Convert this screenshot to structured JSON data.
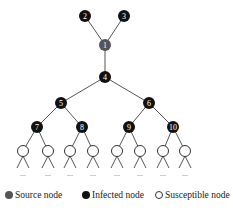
{
  "colors": {
    "source": "#555555",
    "infected": "#111111",
    "susceptible": "#ffffff",
    "edge": "#555555"
  },
  "nodes": [
    {
      "id": "1",
      "label": "1",
      "type": "source",
      "x": 105,
      "y": 45
    },
    {
      "id": "2",
      "label": "2",
      "type": "infected",
      "x": 85,
      "y": 16
    },
    {
      "id": "3",
      "label": "3",
      "type": "infected",
      "x": 124,
      "y": 16
    },
    {
      "id": "4",
      "label": "4",
      "type": "infected",
      "x": 105,
      "y": 77
    },
    {
      "id": "5",
      "label": "5",
      "type": "infected",
      "x": 61,
      "y": 103
    },
    {
      "id": "6",
      "label": "6",
      "type": "infected",
      "x": 149,
      "y": 103
    },
    {
      "id": "7",
      "label": "7",
      "type": "infected",
      "x": 37,
      "y": 127
    },
    {
      "id": "8",
      "label": "8",
      "type": "infected",
      "x": 82,
      "y": 127
    },
    {
      "id": "9",
      "label": "9",
      "type": "infected",
      "x": 129,
      "y": 127
    },
    {
      "id": "10",
      "label": "10",
      "type": "infected",
      "x": 173,
      "y": 127
    }
  ],
  "leaves": [
    {
      "parent": "7",
      "x": 23,
      "y": 151
    },
    {
      "parent": "7",
      "x": 48,
      "y": 151
    },
    {
      "parent": "8",
      "x": 70,
      "y": 151
    },
    {
      "parent": "8",
      "x": 93,
      "y": 151
    },
    {
      "parent": "9",
      "x": 117,
      "y": 151
    },
    {
      "parent": "9",
      "x": 140,
      "y": 151
    },
    {
      "parent": "10",
      "x": 163,
      "y": 151
    },
    {
      "parent": "10",
      "x": 185,
      "y": 151
    }
  ],
  "edges": [
    [
      "2",
      "1"
    ],
    [
      "3",
      "1"
    ],
    [
      "1",
      "4"
    ],
    [
      "4",
      "5"
    ],
    [
      "4",
      "6"
    ],
    [
      "5",
      "7"
    ],
    [
      "5",
      "8"
    ],
    [
      "6",
      "9"
    ],
    [
      "6",
      "10"
    ]
  ],
  "continuation_text": "...",
  "legend": {
    "items": [
      {
        "label": "Source node",
        "type": "source"
      },
      {
        "label": "Infected node",
        "type": "infected"
      },
      {
        "label": "Susceptible node",
        "type": "susceptible"
      }
    ]
  }
}
